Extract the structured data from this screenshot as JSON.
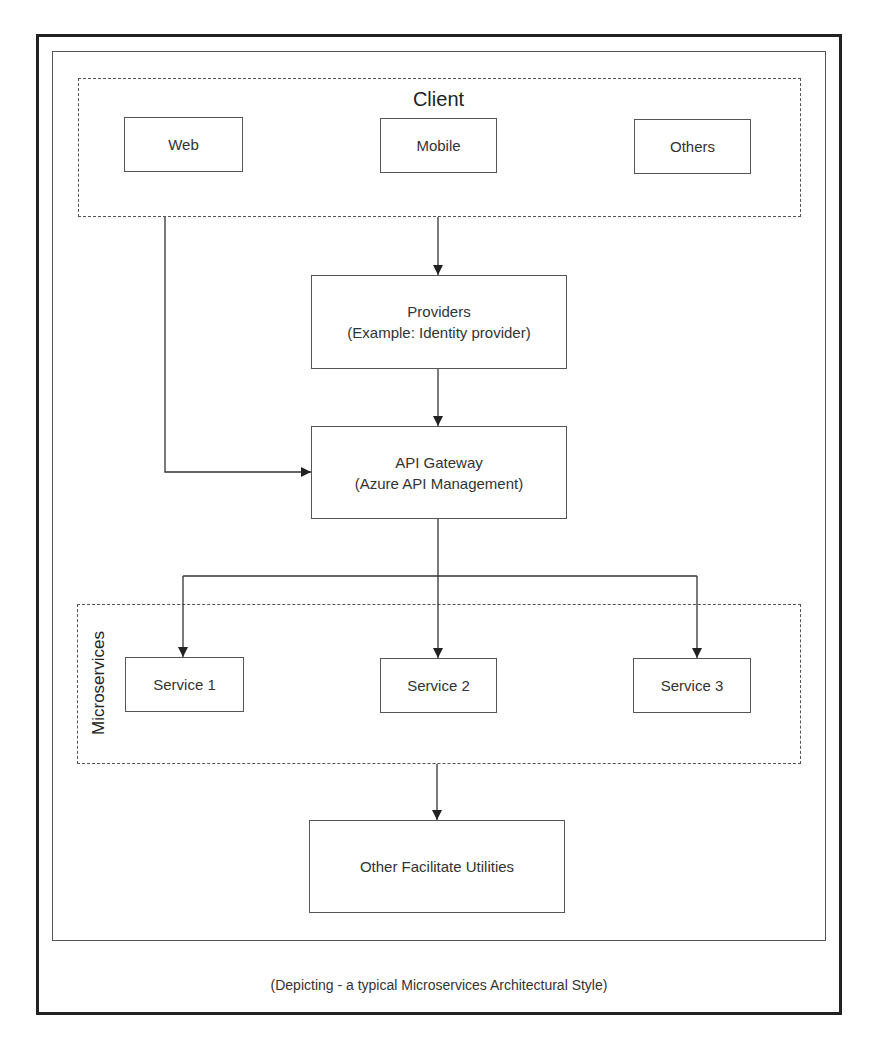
{
  "diagram": {
    "caption": "(Depicting - a typical Microservices Architectural Style)",
    "groups": {
      "client": {
        "label": "Client",
        "nodes": [
          {
            "id": "web",
            "label": "Web"
          },
          {
            "id": "mobile",
            "label": "Mobile"
          },
          {
            "id": "others",
            "label": "Others"
          }
        ]
      },
      "microservices": {
        "label": "Microservices",
        "nodes": [
          {
            "id": "service1",
            "label": "Service 1"
          },
          {
            "id": "service2",
            "label": "Service 2"
          },
          {
            "id": "service3",
            "label": "Service 3"
          }
        ]
      }
    },
    "nodes": {
      "providers": {
        "line1": "Providers",
        "line2": "(Example: Identity provider)"
      },
      "api_gateway": {
        "line1": "API Gateway",
        "line2": "(Azure API Management)"
      },
      "utilities": {
        "label": "Other Facilitate Utilities"
      }
    },
    "edges": [
      {
        "from": "client",
        "to": "providers"
      },
      {
        "from": "providers",
        "to": "api_gateway"
      },
      {
        "from": "web",
        "to": "api_gateway"
      },
      {
        "from": "api_gateway",
        "to": "service1"
      },
      {
        "from": "api_gateway",
        "to": "service2"
      },
      {
        "from": "api_gateway",
        "to": "service3"
      },
      {
        "from": "microservices",
        "to": "utilities"
      }
    ],
    "colors": {
      "line": "#333333",
      "border": "#555555",
      "background": "#ffffff"
    }
  }
}
